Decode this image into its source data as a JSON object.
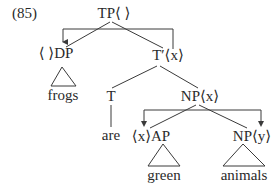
{
  "example_number": "(85)",
  "nodes": {
    "tp": "TP⟨ ⟩",
    "dp": "⟨ ⟩DP",
    "t_bar": "T′⟨x⟩",
    "t": "T",
    "np_top": "NP⟨x⟩",
    "ap": "⟨x⟩AP",
    "np_bottom": "NP⟨y⟩"
  },
  "leaves": {
    "frogs": "frogs",
    "are": "are",
    "green": "green",
    "animals": "animals"
  },
  "colors": {
    "line": "#3a3a3a",
    "text": "#2a2a2a",
    "background": "#ffffff"
  }
}
